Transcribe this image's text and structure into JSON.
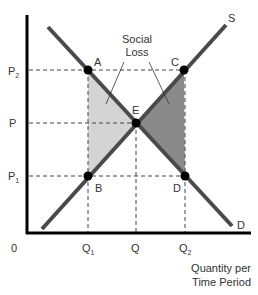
{
  "diagram": {
    "type": "supply-demand",
    "axes": {
      "origin_label": "0",
      "x_label_line1": "Quantity per",
      "x_label_line2": "Time Period"
    },
    "price_labels": [
      {
        "main": "P",
        "sub": "2"
      },
      {
        "main": "P",
        "sub": ""
      },
      {
        "main": "P",
        "sub": "1"
      }
    ],
    "quantity_labels": [
      {
        "main": "Q",
        "sub": "1"
      },
      {
        "main": "Q",
        "sub": ""
      },
      {
        "main": "Q",
        "sub": "2"
      }
    ],
    "curves": {
      "supply_label": "S",
      "demand_label": "D"
    },
    "points": {
      "A": "A",
      "B": "B",
      "C": "C",
      "D": "D",
      "E": "E"
    },
    "annotation": {
      "line1": "Social",
      "line2": "Loss"
    },
    "colors": {
      "left_triangle": "#d4d4d4",
      "right_triangle": "#8a8a8a",
      "curve": "#4a4a4a",
      "axis": "#000000"
    }
  }
}
